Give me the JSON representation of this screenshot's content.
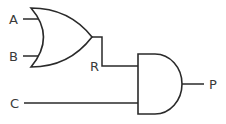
{
  "diagram": {
    "type": "logic-circuit",
    "gates": [
      {
        "id": "or-gate",
        "kind": "OR",
        "inputs": [
          "A",
          "B"
        ],
        "output": "R"
      },
      {
        "id": "and-gate",
        "kind": "AND",
        "inputs": [
          "R",
          "C"
        ],
        "output": "P"
      }
    ],
    "labels": {
      "a": "A",
      "b": "B",
      "r": "R",
      "c": "C",
      "p": "P"
    },
    "colors": {
      "stroke": "#2a2a2a",
      "text": "#3a3a3a",
      "background": "#ffffff"
    }
  }
}
